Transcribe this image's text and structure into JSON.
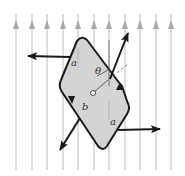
{
  "diagram": {
    "field": {
      "direction": "up",
      "line_count": 11,
      "line_color": "#b8b8b8",
      "x_positions": [
        16,
        32,
        47,
        63,
        78,
        94,
        109,
        125,
        140,
        156,
        171
      ]
    },
    "plate": {
      "fill": "#d4d4d4",
      "stroke": "#1a1a1a"
    },
    "labels": {
      "side_a_top": "a",
      "side_a_bottom": "a",
      "side_b": "b",
      "angle": "θ"
    },
    "forces": [
      {
        "name": "left-force",
        "direction": "left"
      },
      {
        "name": "right-force",
        "direction": "right"
      },
      {
        "name": "upper-right-force",
        "direction": "up-right"
      },
      {
        "name": "lower-left-force",
        "direction": "down-left"
      }
    ]
  }
}
